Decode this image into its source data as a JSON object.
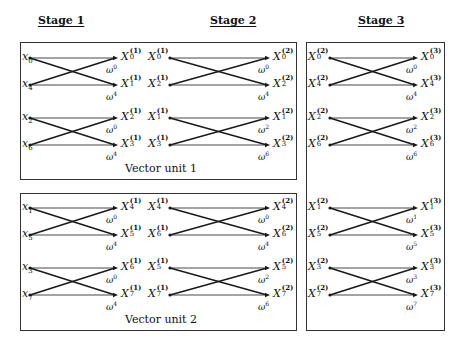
{
  "stages": [
    {
      "title": "Stage 1",
      "x": 38
    },
    {
      "title": "Stage 2",
      "x": 210
    },
    {
      "title": "Stage 3",
      "x": 358
    }
  ],
  "boxes": [
    {
      "name": "vector-unit-1-box",
      "label": "Vector unit 1",
      "x": 20,
      "y": 42,
      "w": 277,
      "h": 138
    },
    {
      "name": "vector-unit-2-box",
      "label": "Vector unit 2",
      "x": 20,
      "y": 193,
      "w": 277,
      "h": 138
    },
    {
      "name": "stage-3-box",
      "label": "",
      "x": 306,
      "y": 42,
      "w": 139,
      "h": 289
    }
  ],
  "vector_units": [
    {
      "label": "Vector unit 1"
    },
    {
      "label": "Vector unit 2"
    }
  ],
  "rows_y": [
    58,
    85,
    118,
    145,
    208,
    235,
    268,
    295
  ],
  "columns": {
    "stage1": {
      "in_x": 30,
      "out_x": 118
    },
    "stage2": {
      "in_x": 170,
      "out_x": 270
    },
    "stage3": {
      "in_x": 330,
      "out_x": 418
    }
  },
  "stage1": {
    "butterflies": [
      {
        "in": [
          "x0",
          "x4"
        ],
        "out": [
          "X0(1)",
          "X1(1)"
        ],
        "twiddles": [
          "ω^0",
          "ω^4"
        ]
      },
      {
        "in": [
          "x2",
          "x6"
        ],
        "out": [
          "X2(1)",
          "X3(1)"
        ],
        "twiddles": [
          "ω^0",
          "ω^4"
        ]
      },
      {
        "in": [
          "x1",
          "x5"
        ],
        "out": [
          "X4(1)",
          "X5(1)"
        ],
        "twiddles": [
          "ω^0",
          "ω^4"
        ]
      },
      {
        "in": [
          "x3",
          "x7"
        ],
        "out": [
          "X6(1)",
          "X7(1)"
        ],
        "twiddles": [
          "ω^0",
          "ω^4"
        ]
      }
    ],
    "inputs": [
      {
        "base": "x",
        "sub": "0"
      },
      {
        "base": "x",
        "sub": "4"
      },
      {
        "base": "x",
        "sub": "2"
      },
      {
        "base": "x",
        "sub": "6"
      },
      {
        "base": "x",
        "sub": "1"
      },
      {
        "base": "x",
        "sub": "5"
      },
      {
        "base": "x",
        "sub": "3"
      },
      {
        "base": "x",
        "sub": "7"
      }
    ],
    "outputs": [
      {
        "base": "X",
        "sub": "0",
        "sup": "(1)"
      },
      {
        "base": "X",
        "sub": "1",
        "sup": "(1)"
      },
      {
        "base": "X",
        "sub": "2",
        "sup": "(1)"
      },
      {
        "base": "X",
        "sub": "3",
        "sup": "(1)"
      },
      {
        "base": "X",
        "sub": "4",
        "sup": "(1)"
      },
      {
        "base": "X",
        "sub": "5",
        "sup": "(1)"
      },
      {
        "base": "X",
        "sub": "6",
        "sup": "(1)"
      },
      {
        "base": "X",
        "sub": "7",
        "sup": "(1)"
      }
    ],
    "twiddles": [
      "0",
      "4",
      "0",
      "4",
      "0",
      "4",
      "0",
      "4"
    ]
  },
  "stage2": {
    "inputs": [
      {
        "base": "X",
        "sub": "0",
        "sup": "(1)"
      },
      {
        "base": "X",
        "sub": "2",
        "sup": "(1)"
      },
      {
        "base": "X",
        "sub": "1",
        "sup": "(1)"
      },
      {
        "base": "X",
        "sub": "3",
        "sup": "(1)"
      },
      {
        "base": "X",
        "sub": "4",
        "sup": "(1)"
      },
      {
        "base": "X",
        "sub": "6",
        "sup": "(1)"
      },
      {
        "base": "X",
        "sub": "5",
        "sup": "(1)"
      },
      {
        "base": "X",
        "sub": "7",
        "sup": "(1)"
      }
    ],
    "outputs": [
      {
        "base": "X",
        "sub": "0",
        "sup": "(2)"
      },
      {
        "base": "X",
        "sub": "2",
        "sup": "(2)"
      },
      {
        "base": "X",
        "sub": "1",
        "sup": "(2)"
      },
      {
        "base": "X",
        "sub": "3",
        "sup": "(2)"
      },
      {
        "base": "X",
        "sub": "4",
        "sup": "(2)"
      },
      {
        "base": "X",
        "sub": "6",
        "sup": "(2)"
      },
      {
        "base": "X",
        "sub": "5",
        "sup": "(2)"
      },
      {
        "base": "X",
        "sub": "7",
        "sup": "(2)"
      }
    ],
    "twiddles": [
      "0",
      "4",
      "2",
      "6",
      "0",
      "4",
      "2",
      "6"
    ]
  },
  "stage3": {
    "inputs": [
      {
        "base": "X",
        "sub": "0",
        "sup": "(2)"
      },
      {
        "base": "X",
        "sub": "4",
        "sup": "(2)"
      },
      {
        "base": "X",
        "sub": "2",
        "sup": "(2)"
      },
      {
        "base": "X",
        "sub": "6",
        "sup": "(2)"
      },
      {
        "base": "X",
        "sub": "1",
        "sup": "(2)"
      },
      {
        "base": "X",
        "sub": "5",
        "sup": "(2)"
      },
      {
        "base": "X",
        "sub": "3",
        "sup": "(2)"
      },
      {
        "base": "X",
        "sub": "7",
        "sup": "(2)"
      }
    ],
    "outputs": [
      {
        "base": "X",
        "sub": "0",
        "sup": "(3)"
      },
      {
        "base": "X",
        "sub": "4",
        "sup": "(3)"
      },
      {
        "base": "X",
        "sub": "2",
        "sup": "(3)"
      },
      {
        "base": "X",
        "sub": "6",
        "sup": "(3)"
      },
      {
        "base": "X",
        "sub": "1",
        "sup": "(3)"
      },
      {
        "base": "X",
        "sub": "5",
        "sup": "(3)"
      },
      {
        "base": "X",
        "sub": "3",
        "sup": "(3)"
      },
      {
        "base": "X",
        "sub": "7",
        "sup": "(3)"
      }
    ],
    "twiddles": [
      "0",
      "4",
      "2",
      "6",
      "1",
      "5",
      "3",
      "7"
    ]
  },
  "twiddle_symbol": "ω",
  "colors": {
    "line": "#1a1a1a",
    "border": "#333333",
    "background": "#ffffff"
  }
}
